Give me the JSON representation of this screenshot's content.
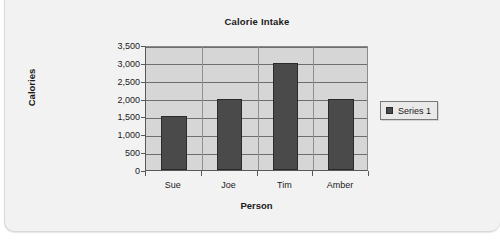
{
  "chart_data": {
    "type": "bar",
    "title": "Calorie Intake",
    "xlabel": "Person",
    "ylabel": "Calories",
    "categories": [
      "Sue",
      "Joe",
      "Tim",
      "Amber"
    ],
    "values": [
      1500,
      2000,
      3000,
      2000
    ],
    "series": [
      {
        "name": "Series 1",
        "values": [
          1500,
          2000,
          3000,
          2000
        ]
      }
    ],
    "ylim": [
      0,
      3500
    ],
    "ytick_step": 500,
    "ytick_labels": [
      "0",
      "500",
      "1,000",
      "1,500",
      "2,000",
      "2,500",
      "3,000",
      "3,500"
    ],
    "grid": true,
    "legend_position": "right",
    "colors": {
      "bar_fill": "#4a4a4a",
      "bar_border": "#2b2b2b",
      "plot_background": "#d6d6d6",
      "gridline": "#6e6e6e",
      "axis": "#585858",
      "card_background": "#f2f2f2",
      "text": "#1a1a1a"
    }
  },
  "legend": {
    "entries": [
      {
        "label": "Series 1"
      }
    ]
  }
}
